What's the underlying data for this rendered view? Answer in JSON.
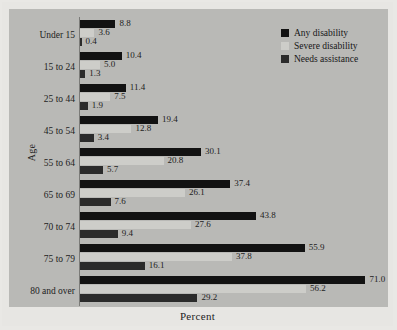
{
  "chart_data": {
    "type": "bar",
    "orientation": "horizontal",
    "title": "",
    "xlabel": "Percent",
    "ylabel": "Age",
    "categories": [
      "Under 15",
      "15 to 24",
      "25 to 44",
      "45 to 54",
      "55 to 64",
      "65 to 69",
      "70 to 74",
      "75 to 79",
      "80 and over"
    ],
    "series": [
      {
        "name": "Any disability",
        "color": "#121212",
        "values": [
          8.8,
          10.4,
          11.4,
          19.4,
          30.1,
          37.4,
          43.8,
          55.9,
          71.0
        ]
      },
      {
        "name": "Severe disability",
        "color": "#cdcdc9",
        "values": [
          3.6,
          5.0,
          7.5,
          12.8,
          20.8,
          26.1,
          27.6,
          37.8,
          56.2
        ]
      },
      {
        "name": "Needs assistance",
        "color": "#2b2b2b",
        "values": [
          0.4,
          1.3,
          1.9,
          3.4,
          5.7,
          7.6,
          9.4,
          16.1,
          29.2
        ]
      }
    ],
    "xlim": [
      0,
      78
    ],
    "grid": false,
    "legend_position": "top-right",
    "value_labels": true,
    "background_color": "#b9b9b6"
  },
  "legend": {
    "items": [
      {
        "label": "Any disability"
      },
      {
        "label": "Severe disability"
      },
      {
        "label": "Needs assistance"
      }
    ]
  },
  "axes": {
    "y_title": "Age",
    "x_title": "Percent"
  }
}
